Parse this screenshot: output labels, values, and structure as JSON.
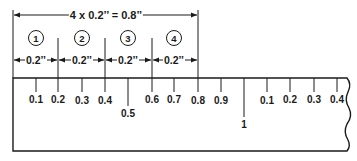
{
  "diagram": {
    "title_dimension": "4 x 0.2’’ = 0.8’’",
    "segments": [
      {
        "number": "1",
        "dimension": "0.2’’"
      },
      {
        "number": "2",
        "dimension": "0.2’’"
      },
      {
        "number": "3",
        "dimension": "0.2’’"
      },
      {
        "number": "4",
        "dimension": "0.2’’"
      }
    ],
    "ruler": {
      "tick_labels": [
        "0.1",
        "0.2",
        "0.3",
        "0.4",
        "0.5",
        "0.6",
        "0.7",
        "0.8",
        "0.9",
        "1",
        "0.1",
        "0.2",
        "0.3",
        "0.4"
      ],
      "colors": {
        "line": "#1a1a1a",
        "background": "#ffffff"
      }
    }
  }
}
